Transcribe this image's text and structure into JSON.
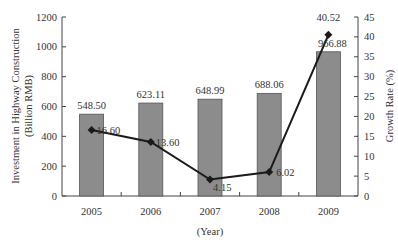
{
  "chart_data": {
    "type": "bar+line",
    "categories": [
      "2005",
      "2006",
      "2007",
      "2008",
      "2009"
    ],
    "series": [
      {
        "name": "Investment in Highway Construction",
        "type": "bar",
        "axis": "left",
        "values": [
          548.5,
          623.11,
          648.99,
          688.06,
          966.88
        ],
        "labels": [
          "548.50",
          "623.11",
          "648.99",
          "688.06",
          "966.88"
        ],
        "color": "#8c8c8c"
      },
      {
        "name": "Growth Rate",
        "type": "line",
        "axis": "right",
        "values": [
          16.6,
          13.6,
          4.15,
          6.02,
          40.52
        ],
        "labels": [
          "16.60",
          "13.60",
          "4.15",
          "6.02",
          "40.52"
        ],
        "color": "#1a1a1a"
      }
    ],
    "title": "",
    "xlabel": "(Year)",
    "ylabel_left": "Investment in Highway Construction (Billion RMB)",
    "ylabel_left_lines": [
      "Investment in Highway Construction",
      "(Billion RMB)"
    ],
    "ylabel_right": "Growth Rate (%)",
    "ylim_left": [
      0,
      1200
    ],
    "ylim_right": [
      0,
      45
    ],
    "yticks_left": [
      0,
      200,
      400,
      600,
      800,
      1000,
      1200
    ],
    "yticks_right": [
      0,
      5,
      10,
      15,
      20,
      25,
      30,
      35,
      40,
      45
    ],
    "grid": false,
    "legend": "none"
  },
  "colors": {
    "bar_fill": "#8c8c8c",
    "bar_stroke": "#555555",
    "line": "#1a1a1a",
    "axis": "#444444",
    "text": "#333333"
  }
}
